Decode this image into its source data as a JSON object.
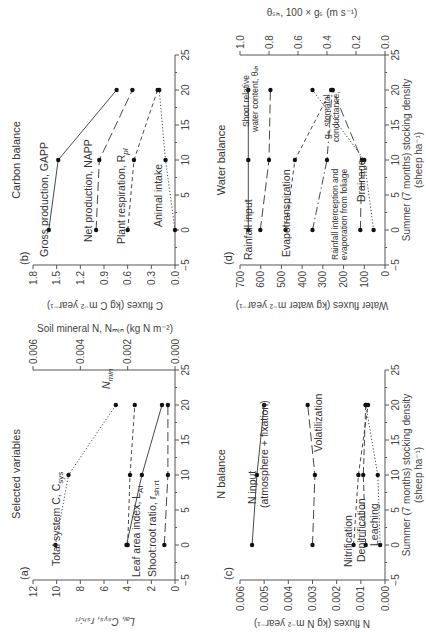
{
  "figure": {
    "rotation_deg": -90,
    "xlabel_line1": "Summer (7 months) stocking density",
    "xlabel_line2": "(sheep ha⁻¹)",
    "x_ticks": [
      "−5",
      "0",
      "5",
      "10",
      "15",
      "20",
      "25"
    ]
  },
  "chart_data": [
    {
      "panel": "(a)",
      "type": "line",
      "title": "Selected variables",
      "xlabel": "Summer (7 months) stocking density (sheep ha⁻¹)",
      "ylabel": "L_AI, C_sys, r_sh:rt",
      "ylabel_right": "Soil mineral N, N_min (kg N m⁻²)",
      "xlim": [
        -5,
        25
      ],
      "ylim": [
        0,
        12
      ],
      "ylim_right": [
        0,
        0.006
      ],
      "y_ticks": [
        "0",
        "2",
        "4",
        "6",
        "8",
        "10",
        "12"
      ],
      "y_ticks_right": [
        "0.000",
        "0.002",
        "0.004",
        "0.006"
      ],
      "x": [
        0,
        10,
        20
      ],
      "series": [
        {
          "name": "Total system C, C_sys",
          "axis": "left",
          "style": "dotted",
          "values": [
            10.1,
            9.0,
            5.0
          ]
        },
        {
          "name": "N_min",
          "axis": "right",
          "style": "short-dash",
          "values": [
            0.002,
            0.0019,
            0.0017
          ]
        },
        {
          "name": "Leaf area index, L_AI",
          "axis": "left",
          "style": "solid",
          "values": [
            4.1,
            2.8,
            1.1
          ]
        },
        {
          "name": "Shoot:root ratio, r_sh:rt",
          "axis": "left",
          "style": "long-dash",
          "values": [
            0.9,
            0.6,
            0.6
          ]
        }
      ]
    },
    {
      "panel": "(b)",
      "type": "line",
      "title": "Carbon balance",
      "xlabel": "",
      "ylabel": "C fluxes (kg C m⁻² year⁻¹)",
      "xlim": [
        -5,
        25
      ],
      "ylim": [
        0,
        1.8
      ],
      "y_ticks": [
        "0.0",
        "0.3",
        "0.6",
        "0.9",
        "1.2",
        "1.5",
        "1.8"
      ],
      "x": [
        0,
        10,
        20
      ],
      "series": [
        {
          "name": "Gross production, GAPP",
          "style": "solid",
          "values": [
            1.6,
            1.48,
            0.74
          ]
        },
        {
          "name": "Net production, NAPP",
          "style": "long-dash",
          "values": [
            1.0,
            0.96,
            0.54
          ]
        },
        {
          "name": "Plant respiration, R_pl",
          "style": "short-dash",
          "values": [
            0.6,
            0.52,
            0.22
          ]
        },
        {
          "name": "Animal intake",
          "style": "dotted",
          "values": [
            0.0,
            0.12,
            0.2
          ]
        }
      ]
    },
    {
      "panel": "(c)",
      "type": "line",
      "title": "N balance",
      "xlabel": "Summer (7 months) stocking density (sheep ha⁻¹)",
      "ylabel": "N fluxes (kg N m⁻² year⁻¹)",
      "xlim": [
        -5,
        25
      ],
      "ylim": [
        0,
        0.006
      ],
      "y_ticks": [
        "0.000",
        "0.001",
        "0.002",
        "0.003",
        "0.004",
        "0.005",
        "0.006"
      ],
      "x": [
        0,
        10,
        20
      ],
      "series": [
        {
          "name": "N input (atmosphere + fixation)",
          "style": "solid",
          "values": [
            0.0055,
            0.0053,
            0.005
          ]
        },
        {
          "name": "Volatilization",
          "style": "long-dash",
          "values": [
            0.003,
            0.0029,
            0.0032
          ]
        },
        {
          "name": "Nitrification",
          "style": "short-dash",
          "values": [
            0.0013,
            0.0011,
            0.0007
          ]
        },
        {
          "name": "Denitrification",
          "style": "dash",
          "values": [
            0.0008,
            0.0009,
            0.0008
          ]
        },
        {
          "name": "Leaching",
          "style": "dotted",
          "values": [
            0.0002,
            0.0003,
            0.0008
          ]
        }
      ]
    },
    {
      "panel": "(d)",
      "type": "line",
      "title": "Water balance",
      "xlabel": "Summer (7 months) stocking density (sheep ha⁻¹)",
      "ylabel": "Water fluxes (kg water m⁻² year⁻¹)",
      "ylabel_right": "θ_sh, 100 × g_s (m s⁻¹)",
      "xlim": [
        -5,
        25
      ],
      "ylim": [
        0,
        700
      ],
      "ylim_right": [
        0,
        1.0
      ],
      "y_ticks": [
        "0",
        "100",
        "200",
        "300",
        "400",
        "500",
        "600",
        "700"
      ],
      "y_ticks_right": [
        "0.0",
        "0.2",
        "0.4",
        "0.6",
        "0.8",
        "1.0"
      ],
      "x": [
        0,
        10,
        20
      ],
      "series": [
        {
          "name": "Rainfall input",
          "axis": "left",
          "style": "solid",
          "values": [
            660,
            660,
            660
          ]
        },
        {
          "name": "Shoot relative water content, θ_sh",
          "axis": "right",
          "style": "long-dash",
          "values": [
            0.86,
            0.8,
            0.79
          ]
        },
        {
          "name": "Evapotranspiration",
          "axis": "left",
          "style": "short-dash",
          "values": [
            480,
            435,
            260
          ]
        },
        {
          "name": "Rainfall interception and evaporation from foliage",
          "axis": "left",
          "style": "dash-dot",
          "values": [
            350,
            280,
            255
          ]
        },
        {
          "name": "g_s, stomatal conductance",
          "axis": "right",
          "style": "long-dash",
          "values": [
            0.17,
            0.16,
            0.36
          ]
        },
        {
          "name": "Drainage",
          "axis": "left",
          "style": "dotted",
          "values": [
            55,
            100,
            350
          ]
        }
      ]
    }
  ],
  "labels": {
    "a": {
      "panel": "(a)",
      "title": "Selected variables",
      "ylabel": "L",
      "ylabel_full": "Lₐᵢ, Cₛᵧₛ, rₛₕ:ᵣₜ",
      "ylabel_right": "Soil mineral N, Nₘᵢₙ (kg N m⁻²)",
      "s1": "Total system C, C",
      "s1_sub": "sys",
      "s2": "N",
      "s2_sub": "min",
      "s3": "Leaf area index, L",
      "s3_sub": "AI",
      "s4": "Shoot:root ratio, r",
      "s4_sub": "sh:rt"
    },
    "b": {
      "panel": "(b)",
      "title": "Carbon balance",
      "ylabel": "C fluxes (kg C m⁻² year⁻¹)",
      "s1": "Gross production, GAPP",
      "s2": "Net production, NAPP",
      "s3": "Plant respiration, R",
      "s3_sub": "pl",
      "s4": "Animal intake"
    },
    "c": {
      "panel": "(c)",
      "title": "N balance",
      "ylabel": "N fluxes (kg N m⁻² year⁻¹)",
      "s1a": "N input",
      "s1b": "(atmosphere + fixation)",
      "s2": "Volatilization",
      "s3": "Nitrification",
      "s4": "Denitrification",
      "s5": "Leaching"
    },
    "d": {
      "panel": "(d)",
      "title": "Water balance",
      "ylabel": "Water fluxes (kg water m⁻² year⁻¹)",
      "ylabel_right": "θₛₕ, 100 × gₛ (m s⁻¹)",
      "s1": "Rainfall input",
      "s2a": "Shoot relative",
      "s2b": "water content, θₛₕ",
      "s3": "Evapotranspiration",
      "s4a": "Rainfall interception and",
      "s4b": "evaporation from foliage",
      "s5a": "gₛ, stomatal",
      "s5b": "conductance,",
      "s6": "Drainage"
    }
  }
}
